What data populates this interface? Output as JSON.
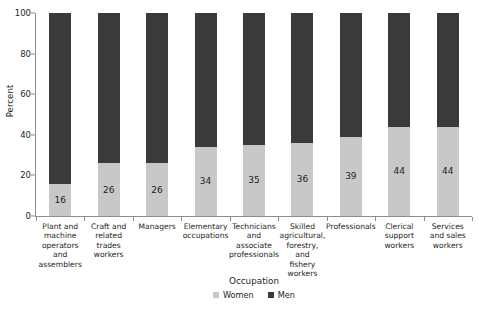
{
  "chart_data": {
    "type": "bar",
    "subtype": "stacked-100-percent",
    "title": "",
    "xlabel": "Occupation",
    "ylabel": "Percent",
    "ylim": [
      0,
      100
    ],
    "yticks": [
      0,
      20,
      40,
      60,
      80,
      100
    ],
    "grid": false,
    "legend_position": "bottom-center",
    "orientation": "vertical",
    "categories": [
      "Plant and machine operators and assemblers",
      "Craft and related trades workers",
      "Managers",
      "Elementary occupations",
      "Technicians and associate professionals",
      "Skilled agricultural, forestry, and fishery workers",
      "Professionals",
      "Clerical support workers",
      "Services and sales workers"
    ],
    "category_label_lines": [
      [
        "Plant and",
        "machine",
        "operators",
        "and",
        "assemblers"
      ],
      [
        "Craft and",
        "related",
        "trades",
        "workers"
      ],
      [
        "Managers"
      ],
      [
        "Elementary",
        "occupations"
      ],
      [
        "Technicians",
        "and",
        "associate",
        "professionals"
      ],
      [
        "Skilled",
        "agricultural,",
        "forestry,",
        "and",
        "fishery",
        "workers"
      ],
      [
        "Professionals"
      ],
      [
        "Clerical",
        "support",
        "workers"
      ],
      [
        "Services",
        "and sales",
        "workers"
      ]
    ],
    "series": [
      {
        "name": "Women",
        "color": "#c8c8c8",
        "values": [
          16,
          26,
          26,
          34,
          35,
          36,
          39,
          44,
          44
        ],
        "labels": [
          "16",
          "26",
          "26",
          "34",
          "35",
          "36",
          "39",
          "44",
          "44"
        ],
        "labels_shown": true
      },
      {
        "name": "Men",
        "color": "#3a3a3a",
        "values": [
          84,
          74,
          74,
          66,
          65,
          64,
          61,
          56,
          56
        ],
        "labels": [
          "84",
          "74",
          "74",
          "66",
          "65",
          "64",
          "61",
          "56",
          "56"
        ],
        "labels_shown": false
      }
    ],
    "legend": [
      {
        "label": "Women",
        "color": "#c8c8c8"
      },
      {
        "label": "Men",
        "color": "#3a3a3a"
      }
    ],
    "ytick_labels": [
      "0",
      "20",
      "40",
      "60",
      "80",
      "100"
    ],
    "axis_color": "#8d8d8d",
    "text_color": "#231f20",
    "background_color": "#ffffff"
  }
}
